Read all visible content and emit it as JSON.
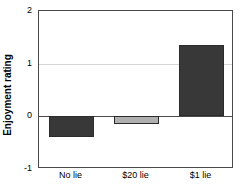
{
  "chart_data": {
    "type": "bar",
    "title": "",
    "subtitle": "",
    "xlabel": "",
    "ylabel": "Enjoyment rating",
    "categories": [
      "No lie",
      "$20 lie",
      "$1 lie"
    ],
    "values": [
      -0.4,
      -0.15,
      1.35
    ],
    "series": [
      {
        "name": "Enjoyment rating",
        "values": [
          -0.4,
          -0.15,
          1.35
        ]
      }
    ],
    "bar_colors": [
      "#383838",
      "#b0b0b0",
      "#383838"
    ],
    "bar_edge_color": "#2b2b2b",
    "ylim": [
      -1,
      2
    ],
    "yticks": [
      2,
      1,
      0,
      -1
    ],
    "ytick_labels": [
      "2",
      "1",
      "0",
      "-1"
    ],
    "gridlines": [
      1
    ],
    "grid": true,
    "grid_color": "#d6d6d6",
    "zero_line": 0,
    "zero_line_color": "#4a4a4a",
    "axis_color": "#4a4a4a",
    "legend": null,
    "legend_position": "none",
    "annotations": []
  }
}
